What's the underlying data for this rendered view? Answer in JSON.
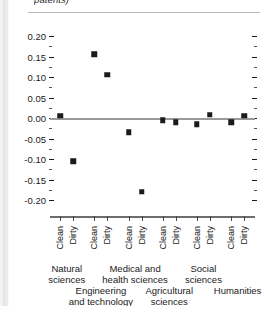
{
  "caption": {
    "text": "patents)"
  },
  "chart_data": {
    "type": "scatter",
    "title": "",
    "subtitle": "",
    "xlabel": "",
    "ylabel": "",
    "ylim": [
      -0.2,
      0.2
    ],
    "ytick_labels": [
      "0.20",
      "0.15",
      "0.10",
      "0.05",
      "0.00",
      "-0.05",
      "-0.10",
      "-0.15",
      "-0.20"
    ],
    "ytick_values": [
      0.2,
      0.15,
      0.1,
      0.05,
      0.0,
      -0.05,
      -0.1,
      -0.15,
      -0.2
    ],
    "minor_ticks": true,
    "grid": false,
    "zero_reference_line": true,
    "legend": "none",
    "categories": [
      "Clean",
      "Dirty"
    ],
    "groups": [
      {
        "name": "Natural sciences",
        "lines": [
          "Natural",
          "sciences"
        ],
        "row": 0
      },
      {
        "name": "Engineering and technology",
        "lines": [
          "Engineering",
          "and technology"
        ],
        "row": 1
      },
      {
        "name": "Medical and health sciences",
        "lines": [
          "Medical and",
          "health sciences"
        ],
        "row": 0
      },
      {
        "name": "Agricultural sciences",
        "lines": [
          "Agricultural",
          "sciences"
        ],
        "row": 1
      },
      {
        "name": "Social sciences",
        "lines": [
          "Social",
          "sciences"
        ],
        "row": 0
      },
      {
        "name": "Humanities",
        "lines": [
          "Humanities"
        ],
        "row": 1
      }
    ],
    "points": [
      {
        "group": "Natural sciences",
        "category": "Clean",
        "value": 0.005
      },
      {
        "group": "Natural sciences",
        "category": "Dirty",
        "value": -0.105
      },
      {
        "group": "Engineering and technology",
        "category": "Clean",
        "value": 0.155
      },
      {
        "group": "Engineering and technology",
        "category": "Dirty",
        "value": 0.105
      },
      {
        "group": "Medical and health sciences",
        "category": "Clean",
        "value": -0.035
      },
      {
        "group": "Medical and health sciences",
        "category": "Dirty",
        "value": -0.18
      },
      {
        "group": "Agricultural sciences",
        "category": "Clean",
        "value": -0.005
      },
      {
        "group": "Agricultural sciences",
        "category": "Dirty",
        "value": -0.01
      },
      {
        "group": "Social sciences",
        "category": "Clean",
        "value": -0.015
      },
      {
        "group": "Social sciences",
        "category": "Dirty",
        "value": 0.008
      },
      {
        "group": "Humanities",
        "category": "Clean",
        "value": -0.01
      },
      {
        "group": "Humanities",
        "category": "Dirty",
        "value": 0.005
      }
    ],
    "marker": {
      "shape": "square",
      "color": "#1b1b1b",
      "size": 5.5
    }
  }
}
